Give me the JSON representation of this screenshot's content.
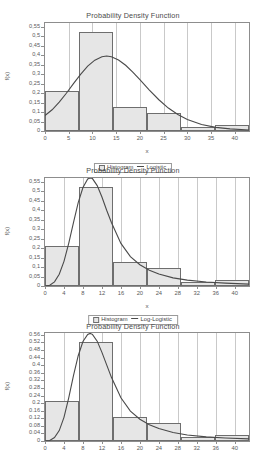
{
  "charts": [
    {
      "title": "Probability Density Function",
      "xlabel": "x",
      "ylabel": "f(x)",
      "legend": {
        "histogram": "Histogram",
        "curve": "Logistic"
      },
      "chart_data": {
        "type": "bar",
        "title": "Probability Density Function",
        "xlabel": "x",
        "ylabel": "f(x)",
        "grid": true,
        "legend_position": "bottom",
        "xlim": [
          0,
          43
        ],
        "ylim": [
          0,
          0.57
        ],
        "xticks": [
          0,
          5,
          10,
          15,
          20,
          25,
          30,
          35,
          40
        ],
        "xticklabels": [
          "0",
          "5",
          "10",
          "15",
          "20",
          "25",
          "30",
          "35",
          "40"
        ],
        "yticks": [
          0,
          0.05,
          0.1,
          0.15,
          0.2,
          0.25,
          0.3,
          0.35,
          0.4,
          0.45,
          0.5,
          0.55
        ],
        "yticklabels": [
          "0",
          "0,05",
          "0,1",
          "0,15",
          "0,2",
          "0,25",
          "0,3",
          "0,35",
          "0,4",
          "0,45",
          "0,5",
          "0,55"
        ],
        "bin_edges": [
          0,
          7.17,
          14.33,
          21.5,
          28.67,
          35.83,
          43
        ],
        "values": [
          0.21,
          0.525,
          0.125,
          0.095,
          0.02,
          0.03
        ],
        "series": [
          {
            "name": "Logistic",
            "type": "line",
            "x": [
              0,
              1.5,
              3,
              4.5,
              6,
              7.5,
              9,
              10.5,
              12,
              13,
              14,
              15.5,
              17,
              18.5,
              20,
              22,
              24,
              26,
              28,
              30,
              33,
              36,
              39,
              43
            ],
            "y": [
              0.082,
              0.112,
              0.152,
              0.199,
              0.25,
              0.299,
              0.342,
              0.374,
              0.392,
              0.396,
              0.392,
              0.375,
              0.347,
              0.311,
              0.271,
              0.216,
              0.165,
              0.121,
              0.087,
              0.061,
              0.034,
              0.019,
              0.011,
              0.005
            ]
          }
        ]
      }
    },
    {
      "title": "Probability Density Function",
      "xlabel": "x",
      "ylabel": "f(x)",
      "legend": {
        "histogram": "Histogram",
        "curve": "Log-Logistic"
      },
      "chart_data": {
        "type": "bar",
        "title": "Probability Density Function",
        "xlabel": "x",
        "ylabel": "f(x)",
        "grid": true,
        "legend_position": "bottom",
        "xlim": [
          0,
          43
        ],
        "ylim": [
          0,
          0.57
        ],
        "xticks": [
          0,
          4,
          8,
          12,
          16,
          20,
          24,
          28,
          32,
          36,
          40
        ],
        "xticklabels": [
          "0",
          "4",
          "8",
          "12",
          "16",
          "20",
          "24",
          "28",
          "32",
          "36",
          "40"
        ],
        "yticks": [
          0,
          0.05,
          0.1,
          0.15,
          0.2,
          0.25,
          0.3,
          0.35,
          0.4,
          0.45,
          0.5,
          0.55
        ],
        "yticklabels": [
          "0",
          "0,05",
          "0,1",
          "0,15",
          "0,2",
          "0,25",
          "0,3",
          "0,35",
          "0,4",
          "0,45",
          "0,5",
          "0,55"
        ],
        "bin_edges": [
          0,
          7.17,
          14.33,
          21.5,
          28.67,
          35.83,
          43
        ],
        "values": [
          0.21,
          0.525,
          0.125,
          0.095,
          0.02,
          0.03
        ],
        "series": [
          {
            "name": "Log-Logistic",
            "type": "line",
            "x": [
              0,
              1,
              2,
              3,
              4,
              5,
              6,
              7,
              8,
              9,
              9.5,
              10,
              11,
              12,
              13,
              14,
              16,
              18,
              20,
              22,
              24,
              27,
              30,
              34,
              38,
              43
            ],
            "y": [
              0.0,
              0.004,
              0.022,
              0.062,
              0.13,
              0.225,
              0.335,
              0.44,
              0.52,
              0.565,
              0.572,
              0.567,
              0.53,
              0.47,
              0.4,
              0.335,
              0.225,
              0.155,
              0.112,
              0.083,
              0.063,
              0.043,
              0.031,
              0.021,
              0.015,
              0.01
            ]
          }
        ]
      }
    },
    {
      "title": "Probability Density Function",
      "xlabel": "",
      "ylabel": "f(x)",
      "legend": null,
      "chart_data": {
        "type": "bar",
        "title": "Probability Density Function",
        "xlabel": "",
        "ylabel": "f(x)",
        "grid": true,
        "legend_position": "none",
        "xlim": [
          0,
          43
        ],
        "ylim": [
          0,
          0.57
        ],
        "xticks": [
          0,
          4,
          8,
          12,
          16,
          20,
          24,
          28,
          32,
          36,
          40
        ],
        "xticklabels": [
          "0",
          "4",
          "8",
          "12",
          "16",
          "20",
          "24",
          "28",
          "32",
          "36",
          "40"
        ],
        "yticks": [
          0,
          0.04,
          0.08,
          0.12,
          0.16,
          0.2,
          0.24,
          0.28,
          0.32,
          0.36,
          0.4,
          0.44,
          0.48,
          0.52,
          0.56
        ],
        "yticklabels": [
          "0",
          "0.04",
          "0.08",
          "0.12",
          "0.16",
          "0.2",
          "0.24",
          "0.28",
          "0.32",
          "0.36",
          "0.4",
          "0.44",
          "0.48",
          "0.52",
          "0.56"
        ],
        "bin_edges": [
          0,
          7.17,
          14.33,
          21.5,
          28.67,
          35.83,
          43
        ],
        "values": [
          0.21,
          0.525,
          0.125,
          0.095,
          0.02,
          0.03
        ],
        "series": [
          {
            "name": "Fitted",
            "type": "line",
            "x": [
              0,
              1,
              2,
              3,
              4,
              5,
              6,
              7,
              8,
              9,
              9.5,
              10,
              11,
              12,
              13,
              14,
              16,
              18,
              20,
              22,
              24,
              27,
              30,
              34,
              38,
              43
            ],
            "y": [
              0.0,
              0.003,
              0.018,
              0.055,
              0.125,
              0.228,
              0.345,
              0.45,
              0.525,
              0.562,
              0.568,
              0.563,
              0.527,
              0.468,
              0.402,
              0.336,
              0.228,
              0.158,
              0.115,
              0.086,
              0.066,
              0.045,
              0.032,
              0.022,
              0.016,
              0.011
            ]
          }
        ]
      }
    }
  ]
}
